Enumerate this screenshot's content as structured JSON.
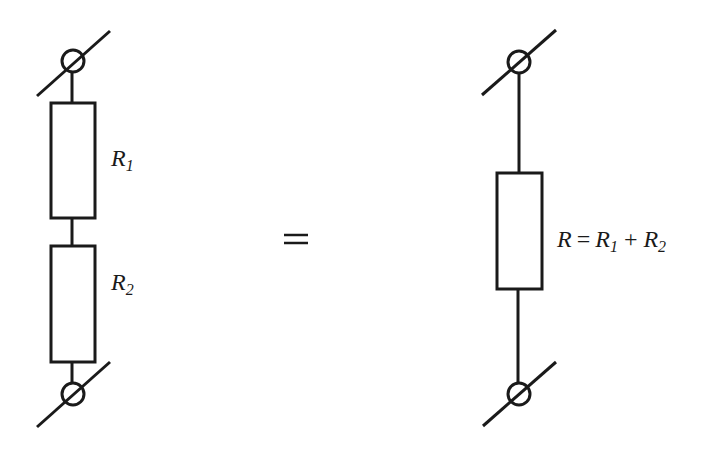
{
  "diagram": {
    "left_circuit": {
      "resistors": [
        {
          "symbol": "R",
          "subscript": "1"
        },
        {
          "symbol": "R",
          "subscript": "2"
        }
      ],
      "terminals": [
        "top-terminal",
        "bottom-terminal"
      ]
    },
    "equals_sign": "=",
    "right_circuit": {
      "resistor": {
        "symbol": "R"
      },
      "formula": {
        "lhs": "R",
        "eq": "=",
        "term1": {
          "symbol": "R",
          "subscript": "1"
        },
        "plus": "+",
        "term2": {
          "symbol": "R",
          "subscript": "2"
        }
      }
    },
    "colors": {
      "stroke": "#1a1a1a",
      "background": "#ffffff"
    }
  }
}
